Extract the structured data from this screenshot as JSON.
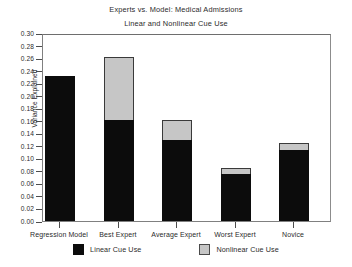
{
  "chart_data": {
    "type": "bar",
    "title": "Experts vs. Model: Medical Admissions",
    "subtitle": "Linear and Nonlinear Cue Use",
    "xlabel": "",
    "ylabel": "Variance Explained",
    "ylim": [
      0.0,
      0.3
    ],
    "ytick_step": 0.02,
    "ytick_labels": [
      "0.30",
      "0.28",
      "0.26",
      "0.24",
      "0.22",
      "0.20",
      "0.18",
      "0.16",
      "0.14",
      "0.12",
      "0.10",
      "0.08",
      "0.06",
      "0.04",
      "0.02",
      "0.00"
    ],
    "grid": false,
    "stacked": true,
    "legend_position": "bottom",
    "categories": [
      "Regression Model",
      "Best Expert",
      "Average Expert",
      "Worst Expert",
      "Novice"
    ],
    "series": [
      {
        "name": "Linear Cue Use",
        "color": "#0c0c0c",
        "values": [
          0.232,
          0.161,
          0.13,
          0.075,
          0.113
        ]
      },
      {
        "name": "Nonlinear Cue Use",
        "color": "#c6c6c6",
        "values": [
          0.0,
          0.1,
          0.032,
          0.009,
          0.011
        ]
      }
    ],
    "totals": [
      0.232,
      0.261,
      0.162,
      0.084,
      0.124
    ]
  }
}
